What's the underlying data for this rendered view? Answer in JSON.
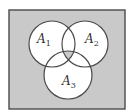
{
  "diagram": {
    "type": "venn",
    "universe": {
      "x": 9,
      "y": 10,
      "width": 116,
      "height": 99,
      "fill": "#c9c9c9",
      "stroke": "#4a4a4a"
    },
    "circle_fill": "#ffffff",
    "circle_stroke": "#4a4a4a",
    "intersection_fill": "#c9c9c9",
    "sets": [
      {
        "id": "A1",
        "letter": "A",
        "subscript": "1",
        "cx": 52,
        "cy": 44,
        "r": 23,
        "label_x": 37,
        "label_y": 43
      },
      {
        "id": "A2",
        "letter": "A",
        "subscript": "2",
        "cx": 85,
        "cy": 44,
        "r": 23,
        "label_x": 85,
        "label_y": 43
      },
      {
        "id": "A3",
        "letter": "A",
        "subscript": "3",
        "cx": 68,
        "cy": 75,
        "r": 24,
        "label_x": 62,
        "label_y": 85
      }
    ],
    "shaded_regions": [
      "complement of A1 ∪ A2 ∪ A3",
      "A1 ∩ A2 ∩ A3"
    ]
  }
}
